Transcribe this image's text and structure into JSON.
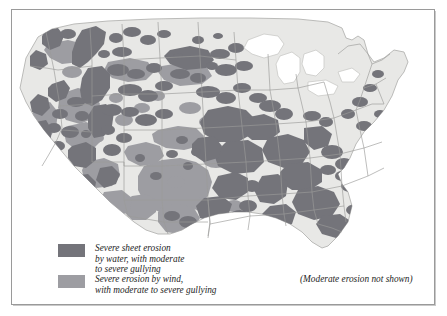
{
  "figure": {
    "kind": "thematic-map",
    "region": "Contiguous United States"
  },
  "colors": {
    "frame_rule": "#9a9a9a",
    "page_background": "#ffffff",
    "land_fill": "#e8e8e6",
    "land_outline": "#b4b4b2",
    "state_boundary": "#9b9b99",
    "water_erosion": "#74747a",
    "wind_erosion": "#9d9da2",
    "lake_fill": "#ffffff",
    "text": "#1d1d1d"
  },
  "legend": {
    "items": [
      {
        "id": "water-erosion",
        "swatch_color": "#74747a",
        "lines": [
          "Severe sheet erosion",
          "by water, with moderate",
          "to severe gullying"
        ]
      },
      {
        "id": "wind-erosion",
        "swatch_color": "#9d9da2",
        "lines": [
          "Severe erosion by wind,",
          "with moderate to severe gullying"
        ]
      }
    ],
    "note": "(Moderate erosion not shown)"
  },
  "map_data": {
    "type": "choropleth-patch",
    "classes": [
      "water_erosion",
      "wind_erosion",
      "moderate_or_none"
    ],
    "lakes_shown_as": "white cutouts",
    "states_outlined": true,
    "projection_note": "Albers-like conic, contiguous 48 states only"
  }
}
